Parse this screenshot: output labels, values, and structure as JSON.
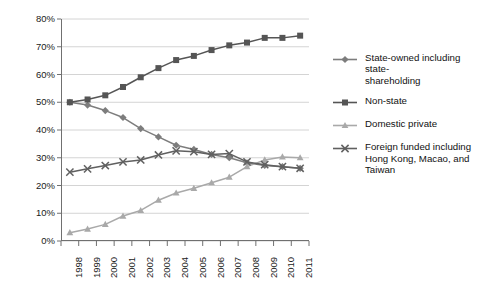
{
  "chart_data": {
    "type": "line",
    "title": "",
    "subtitle": "",
    "xlabel": "",
    "ylabel": "",
    "grid": true,
    "legend_position": "right",
    "x": [
      1998,
      1999,
      2000,
      2001,
      2002,
      2003,
      2004,
      2005,
      2006,
      2007,
      2008,
      2009,
      2010,
      2011
    ],
    "categories": [
      "1998",
      "1999",
      "2000",
      "2001",
      "2002",
      "2003",
      "2004",
      "2005",
      "2006",
      "2007",
      "2008",
      "2009",
      "2010",
      "2011"
    ],
    "ylim": [
      0,
      80
    ],
    "ytick_labels": [
      "0%",
      "10%",
      "20%",
      "30%",
      "40%",
      "50%",
      "60%",
      "70%",
      "80%"
    ],
    "ytick_values": [
      0,
      10,
      20,
      30,
      40,
      50,
      60,
      70,
      80
    ],
    "series": [
      {
        "name": "State-owned including state-shareholding",
        "legend_label": "State-owned including state-\nshareholding",
        "color": "#7d7d7d",
        "marker": "diamond",
        "values": [
          50.0,
          49.0,
          47.0,
          44.5,
          40.5,
          37.5,
          34.5,
          33.0,
          31.2,
          30.0,
          28.2,
          27.2,
          26.8,
          26.2
        ]
      },
      {
        "name": "Non-state",
        "legend_label": "Non-state",
        "color": "#555555",
        "marker": "square",
        "values": [
          50.0,
          51.0,
          52.5,
          55.5,
          59.0,
          62.3,
          65.2,
          66.7,
          68.8,
          70.5,
          71.5,
          73.2,
          73.2,
          74.0
        ]
      },
      {
        "name": "Domestic private",
        "legend_label": "Domestic private",
        "color": "#a9a9a9",
        "marker": "triangle",
        "values": [
          3.0,
          4.3,
          6.0,
          9.0,
          11.0,
          14.7,
          17.3,
          19.0,
          21.0,
          23.0,
          26.8,
          29.2,
          30.3,
          30.0
        ]
      },
      {
        "name": "Foreign funded including Hong Kong, Macao, and Taiwan",
        "legend_label": "Foreign funded including\nHong Kong, Macao, and\nTaiwan",
        "color": "#606060",
        "marker": "cross",
        "values": [
          24.8,
          26.0,
          27.2,
          28.5,
          29.2,
          31.0,
          32.5,
          32.2,
          31.2,
          31.5,
          28.5,
          27.5,
          26.8,
          26.2
        ]
      }
    ]
  }
}
